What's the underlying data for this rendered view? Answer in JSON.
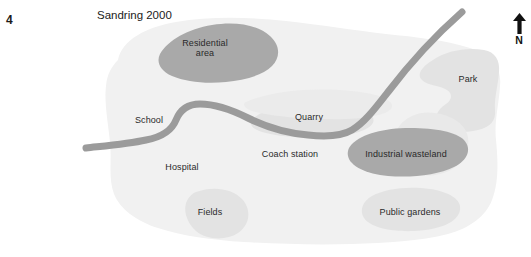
{
  "figure": {
    "item_number": "4",
    "title": "Sandring 2000",
    "top_cut_text": "",
    "width": 531,
    "height": 257
  },
  "compass": {
    "icon": "north-arrow-icon",
    "label": "N"
  },
  "colors": {
    "page_background": "#ffffff",
    "landmass": "#f1f1f1",
    "feature_light": "#e3e3e3",
    "feature_dark": "#a9a9a9",
    "road": "#9b9b9b",
    "label_text": "#2a2a2a",
    "title_text": "#1b1b1b"
  },
  "map": {
    "name": "Sandring 2000",
    "areas": [
      {
        "id": "residential-area",
        "label": "Residential\narea",
        "shade": "dark",
        "x": 205,
        "y": 45
      },
      {
        "id": "park",
        "label": "Park",
        "shade": "light",
        "x": 468,
        "y": 79
      },
      {
        "id": "quarry",
        "label": "Quarry",
        "shade": "light",
        "x": 309,
        "y": 117
      },
      {
        "id": "industrial-wasteland",
        "label": "Industrial wasteland",
        "shade": "dark",
        "x": 406,
        "y": 154
      },
      {
        "id": "fields",
        "label": "Fields",
        "shade": "light",
        "x": 210,
        "y": 212
      },
      {
        "id": "public-gardens",
        "label": "Public gardens",
        "shade": "light",
        "x": 410,
        "y": 212
      },
      {
        "id": "school",
        "label": "School",
        "shade": "none",
        "x": 149,
        "y": 120
      },
      {
        "id": "hospital",
        "label": "Hospital",
        "shade": "none",
        "x": 182,
        "y": 167
      },
      {
        "id": "coach-station",
        "label": "Coach station",
        "shade": "none",
        "x": 290,
        "y": 154
      }
    ],
    "road": {
      "id": "main-road",
      "label": ""
    }
  }
}
